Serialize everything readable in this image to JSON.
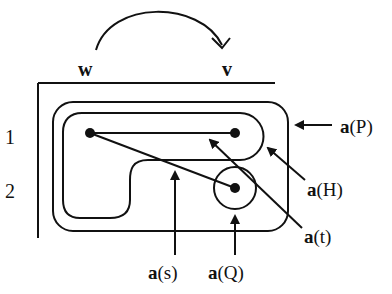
{
  "diagram": {
    "top_labels": {
      "w": "w",
      "v": "v"
    },
    "row_labels": [
      "1",
      "2"
    ],
    "annotations": {
      "aP": {
        "bold": "a",
        "arg": "(P)"
      },
      "aH": {
        "bold": "a",
        "arg": "(H)"
      },
      "at": {
        "bold": "a",
        "arg": "(t)"
      },
      "as": {
        "bold": "a",
        "arg": "(s)"
      },
      "aQ": {
        "bold": "a",
        "arg": "(Q)"
      }
    },
    "colors": {
      "stroke": "#111111",
      "background": "#ffffff"
    }
  }
}
